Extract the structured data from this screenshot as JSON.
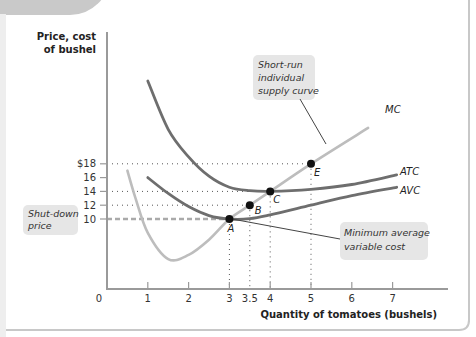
{
  "chart_data": {
    "type": "line",
    "title": "",
    "ylabel": "Price, cost of bushel",
    "xlabel": "Quantity of tomatoes (bushels)",
    "xlim": [
      0,
      8
    ],
    "ylim": [
      0,
      22
    ],
    "x_ticks": [
      {
        "value": 0,
        "label": "0"
      },
      {
        "value": 1,
        "label": "1"
      },
      {
        "value": 2,
        "label": "2"
      },
      {
        "value": 3,
        "label": "3"
      },
      {
        "value": 3.5,
        "label": "3.5"
      },
      {
        "value": 4,
        "label": "4"
      },
      {
        "value": 5,
        "label": "5"
      },
      {
        "value": 6,
        "label": "6"
      },
      {
        "value": 7,
        "label": "7"
      }
    ],
    "y_ticks": [
      {
        "value": 10,
        "label": "10"
      },
      {
        "value": 12,
        "label": "12"
      },
      {
        "value": 14,
        "label": "14"
      },
      {
        "value": 16,
        "label": "16"
      },
      {
        "value": 18,
        "label": "$18"
      }
    ],
    "grid": false,
    "series": [
      {
        "name": "MC",
        "label": "MC",
        "color": "#bdbdbd",
        "points": [
          [
            0.5,
            17
          ],
          [
            0.7,
            13
          ],
          [
            1,
            8
          ],
          [
            1.5,
            4.2
          ],
          [
            2,
            4.8
          ],
          [
            2.5,
            7
          ],
          [
            3,
            10
          ],
          [
            3.5,
            12
          ],
          [
            4,
            14
          ],
          [
            5,
            18
          ],
          [
            6.4,
            23.2
          ]
        ]
      },
      {
        "name": "ATC",
        "label": "ATC",
        "color": "#6e6e6e",
        "points": [
          [
            1,
            30
          ],
          [
            1.5,
            23
          ],
          [
            2,
            19
          ],
          [
            2.5,
            16.2
          ],
          [
            3,
            14.6
          ],
          [
            3.5,
            14.1
          ],
          [
            4,
            14
          ],
          [
            5,
            14.3
          ],
          [
            6,
            15
          ],
          [
            7.1,
            16.4
          ]
        ]
      },
      {
        "name": "AVC",
        "label": "AVC",
        "color": "#6e6e6e",
        "points": [
          [
            1,
            16
          ],
          [
            1.5,
            13.7
          ],
          [
            2,
            11.8
          ],
          [
            2.5,
            10.5
          ],
          [
            3,
            10
          ],
          [
            3.5,
            10.05
          ],
          [
            4,
            10.6
          ],
          [
            5,
            12
          ],
          [
            6,
            13.4
          ],
          [
            7.1,
            14.6
          ]
        ]
      }
    ],
    "points": [
      {
        "label": "A",
        "x": 3,
        "y": 10
      },
      {
        "label": "B",
        "x": 3.5,
        "y": 12
      },
      {
        "label": "C",
        "x": 4,
        "y": 14
      },
      {
        "label": "E",
        "x": 5,
        "y": 18
      }
    ],
    "annotations": [
      {
        "text": [
          "Short-run",
          "individual",
          "supply curve"
        ],
        "points_to": "MC"
      },
      {
        "text": [
          "Minimum average",
          "variable cost"
        ],
        "points_to": "A"
      },
      {
        "text": [
          "Shut-down",
          "price"
        ],
        "points_to": "y=10"
      }
    ],
    "shutdown_price": 10
  }
}
